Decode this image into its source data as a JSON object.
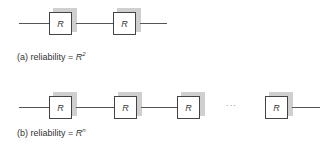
{
  "diagram_a": {
    "block_label": "R",
    "blocks": [
      {
        "label": "R",
        "x": 49,
        "y": 12
      },
      {
        "label": "R",
        "x": 113,
        "y": 12
      }
    ],
    "caption_prefix": "(a) reliability = ",
    "caption_symbol": "R",
    "caption_exponent": "2"
  },
  "diagram_b": {
    "blocks": [
      {
        "label": "R",
        "x": 49,
        "y": 96
      },
      {
        "label": "R",
        "x": 114,
        "y": 96
      },
      {
        "label": "R",
        "x": 177,
        "y": 96
      },
      {
        "label": "R",
        "x": 265,
        "y": 96
      }
    ],
    "ellipsis": "···",
    "caption_prefix": "(b) reliability = ",
    "caption_symbol": "R",
    "caption_exponent": "n"
  },
  "colors": {
    "line": "#555555",
    "box_border": "#444444",
    "shadow": "#cfcfcf"
  }
}
